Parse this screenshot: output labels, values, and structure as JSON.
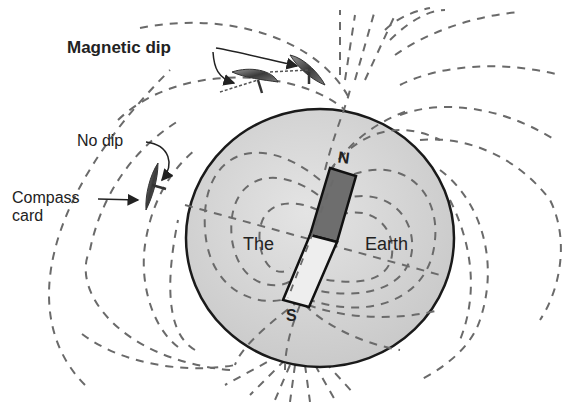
{
  "diagram": {
    "labels": {
      "magnetic_dip": "Magnetic dip",
      "no_dip": "No dip",
      "compass_card_line1": "Compass",
      "compass_card_line2": "card",
      "the": "The",
      "earth": "Earth",
      "north": "N",
      "south": "S"
    },
    "colors": {
      "earth_fill": "#d4d4d4",
      "earth_outline": "#1a1a1a",
      "field_lines": "#6a6a6a",
      "magnet_north": "#6e6e6e",
      "magnet_south": "#eeeeee",
      "text": "#222222"
    }
  }
}
